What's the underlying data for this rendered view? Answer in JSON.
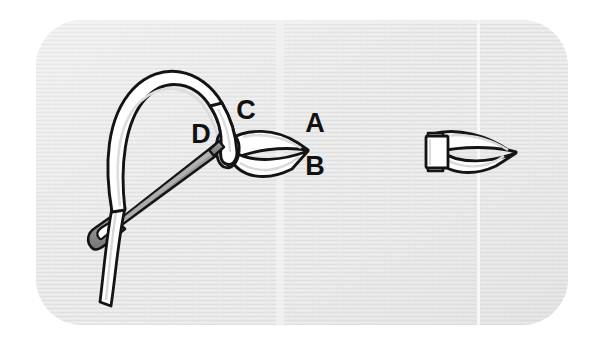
{
  "figure": {
    "canvas": {
      "width": 604,
      "height": 348
    },
    "background": {
      "page_color": "#ffffff",
      "panel_color": "#e7e7e7",
      "panel_texture": "horizontal-woven-lines",
      "panel_rect": {
        "x": 36,
        "y": 20,
        "width": 532,
        "height": 305,
        "radius": 46
      },
      "seam_lines": [
        {
          "name": "left-seam",
          "x": 280,
          "color": "#f2f2f2"
        },
        {
          "name": "right-seam",
          "x": 478,
          "color": "#f6f6f6"
        }
      ]
    },
    "palette": {
      "cord_fill": "#ffffff",
      "cord_shadow": "#d9d9d9",
      "outline": "#141414",
      "needle_fill": "#8a8a8a",
      "needle_highlight": "#b4b4b4",
      "needle_outline": "#141414",
      "label_color": "#111111"
    },
    "labels": [
      {
        "id": "label-a",
        "text": "A",
        "x": 315,
        "y": 132,
        "size": 27
      },
      {
        "id": "label-b",
        "text": "B",
        "x": 315,
        "y": 175,
        "size": 27
      },
      {
        "id": "label-c",
        "text": "C",
        "x": 246,
        "y": 119,
        "size": 27
      },
      {
        "id": "label-d",
        "text": "D",
        "x": 201,
        "y": 143,
        "size": 27
      }
    ],
    "elements": [
      {
        "id": "cord-arc",
        "name": "suture-cord",
        "description": "white cord looping from lower-left up over the top and down through point C"
      },
      {
        "id": "loop-body",
        "name": "suture-loop",
        "description": "pointed almond-shaped loop between C/D and A/B"
      },
      {
        "id": "needle",
        "name": "needle",
        "description": "gray needle angled from lower-left eye up to point D"
      },
      {
        "id": "right-loop",
        "name": "completed-loop",
        "description": "finished loop with rectangular clip at its left end"
      }
    ]
  }
}
